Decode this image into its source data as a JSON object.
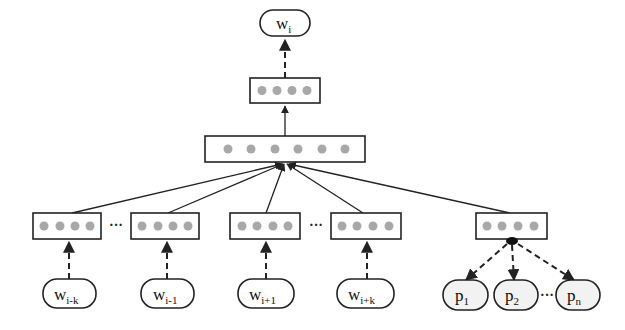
{
  "diagram": {
    "type": "neural-network-architecture",
    "output": {
      "label": "w",
      "subscript": "i"
    },
    "hidden_layer": {
      "dots": 4
    },
    "combined_layer": {
      "dots": 6
    },
    "context_inputs": [
      {
        "label": "w",
        "subscript": "i-k",
        "dots": 4
      },
      {
        "label": "w",
        "subscript": "i-1",
        "dots": 4
      },
      {
        "label": "w",
        "subscript": "i+1",
        "dots": 4
      },
      {
        "label": "w",
        "subscript": "i+k",
        "dots": 4
      }
    ],
    "context_ellipses": [
      "···",
      "···"
    ],
    "param_vector": {
      "dots": 4
    },
    "param_inputs": [
      {
        "label": "p",
        "subscript": "1"
      },
      {
        "label": "p",
        "subscript": "2"
      },
      {
        "label": "p",
        "subscript": "n"
      }
    ],
    "param_ellipsis": "···",
    "colors": {
      "stroke": "#222222",
      "dot": "#a8a8a8",
      "param_fill": "#f2f2f2"
    }
  }
}
